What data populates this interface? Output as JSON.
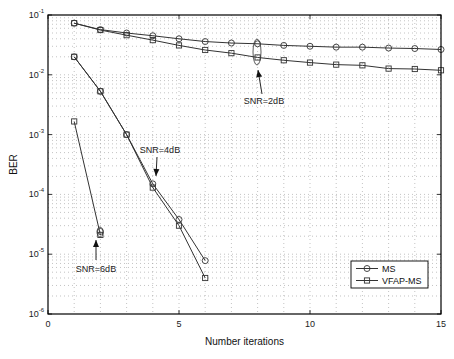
{
  "chart_data": {
    "type": "line",
    "title": "",
    "xlabel": "Number iterations",
    "ylabel": "BER",
    "xlim": [
      0,
      15
    ],
    "ylim": [
      1e-06,
      0.1
    ],
    "yscale": "log",
    "grid": true,
    "legend_position": "lower right",
    "x_ticks": [
      0,
      5,
      10,
      15
    ],
    "x_tick_labels": [
      "0",
      "5",
      "10",
      "15"
    ],
    "y_ticks": [
      -1,
      -2,
      -3,
      -4,
      -5,
      -6
    ],
    "y_tick_labels": [
      "10-1",
      "10-2",
      "10-3",
      "10-4",
      "10-5",
      "10-6"
    ],
    "legend": [
      {
        "name": "MS",
        "marker": "circle"
      },
      {
        "name": "VFAP-MS",
        "marker": "square"
      }
    ],
    "series": [
      {
        "name": "MS",
        "snr": "2dB",
        "marker": "circle",
        "x": [
          1,
          2,
          3,
          4,
          5,
          6,
          7,
          8,
          9,
          10,
          11,
          12,
          13,
          14,
          15
        ],
        "values": [
          0.073,
          0.057,
          0.05,
          0.045,
          0.04,
          0.036,
          0.034,
          0.033,
          0.031,
          0.03,
          0.029,
          0.029,
          0.028,
          0.0275,
          0.0265
        ]
      },
      {
        "name": "VFAP-MS",
        "snr": "2dB",
        "marker": "square",
        "x": [
          1,
          2,
          3,
          4,
          5,
          6,
          7,
          8,
          9,
          10,
          11,
          12,
          13,
          14,
          15
        ],
        "values": [
          0.073,
          0.056,
          0.046,
          0.038,
          0.031,
          0.026,
          0.023,
          0.0195,
          0.0175,
          0.016,
          0.0148,
          0.0144,
          0.0127,
          0.0125,
          0.0119
        ]
      },
      {
        "name": "MS",
        "snr": "4dB",
        "marker": "circle",
        "x": [
          1,
          2,
          3,
          4,
          5,
          6
        ],
        "values": [
          0.02,
          0.0053,
          0.001,
          0.00015,
          3.8e-05,
          7.8e-06
        ]
      },
      {
        "name": "VFAP-MS",
        "snr": "4dB",
        "marker": "square",
        "x": [
          1,
          2,
          3,
          4,
          5,
          6
        ],
        "values": [
          0.02,
          0.0053,
          0.001,
          0.00013,
          3e-05,
          4e-06
        ]
      },
      {
        "name": "MS",
        "snr": "6dB",
        "marker": "circle",
        "x": [
          2
        ],
        "values": [
          2.4e-05
        ]
      },
      {
        "name": "VFAP-MS",
        "snr": "6dB",
        "marker": "square",
        "x": [
          1,
          2
        ],
        "values": [
          0.00166,
          2.1e-05
        ]
      }
    ],
    "annotations": [
      {
        "text": "SNR=2dB",
        "x_px": 264,
        "y_px": 104,
        "arrow_from": [
          262,
          94
        ],
        "arrow_to": [
          258,
          70
        ],
        "ellipse": {
          "cx": 257,
          "cy": 52,
          "rx": 4,
          "ry": 13
        }
      },
      {
        "text": "SNR=4dB",
        "x_px": 160,
        "y_px": 153,
        "arrow_from": [
          157,
          157
        ],
        "arrow_to": [
          156,
          176
        ]
      },
      {
        "text": "SNR=6dB",
        "x_px": 96,
        "y_px": 272,
        "arrow_from": [
          96,
          260
        ],
        "arrow_to": [
          96,
          240
        ],
        "ellipse": {
          "cx": 100,
          "cy": 232,
          "rx": 3,
          "ry": 5
        }
      }
    ]
  },
  "colors": {
    "line": "#333333",
    "frame": "#000000",
    "grid": "#9a9a9a",
    "background": "#ffffff"
  }
}
